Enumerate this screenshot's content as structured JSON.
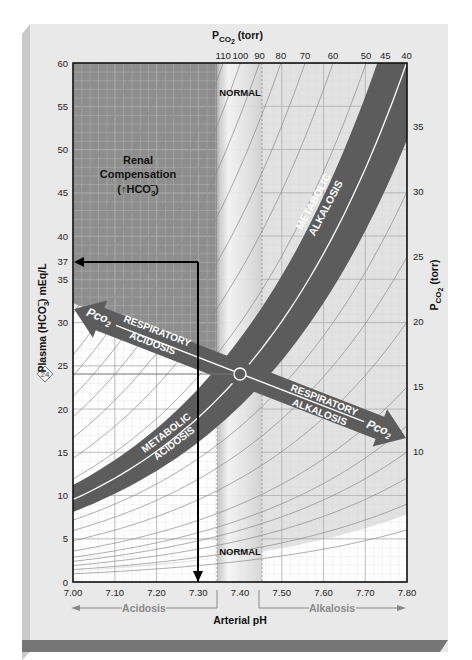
{
  "title": {
    "top_axis_title_main": "P",
    "top_axis_title_sub": "CO",
    "top_axis_title_subsub": "2",
    "top_axis_title_unit": " (torr)"
  },
  "colors": {
    "panel_bg": "#e9e9e9",
    "panel_left_edge": "#cfcfcf",
    "panel_bottom_edge": "#7a7a7a",
    "renal_region": "#8e8e8e",
    "upper_region": "#e2e2e2",
    "lower_region": "#ffffff",
    "band": "#5c5c5c",
    "band_line": "#ffffff",
    "normal_band": "#f1f1f1",
    "normal_band_edge": "#bdbdbd",
    "grid_minor": "#cfcfcf",
    "grid_major": "#a9a9a9",
    "isopleth": "#8a8a8a",
    "frame": "#111111",
    "axis_text": "#222222",
    "region_text": "#8a8a8a"
  },
  "labels": {
    "normal_top": "NORMAL",
    "normal_bottom": "NORMAL",
    "renal_line1": "Renal",
    "renal_line2": "Compensation",
    "renal_line3_pre": "(↑HCO",
    "renal_line3_sub": "3",
    "renal_line3_sup": "−",
    "renal_line3_post": ")",
    "metabolic_alkalosis_1": "METABOLIC",
    "metabolic_alkalosis_2": "ALKALOSIS",
    "metabolic_acidosis_1": "METABOLIC",
    "metabolic_acidosis_2": "ACIDOSIS",
    "respiratory_acidosis_1": "RESPIRATORY",
    "respiratory_acidosis_2": "ACIDOSIS",
    "respiratory_alkalosis_1": "RESPIRATORY",
    "respiratory_alkalosis_2": "ALKALOSIS",
    "pco2_arrow_main": "Pco",
    "pco2_arrow_sub": "2",
    "normal_marker": "24",
    "acidosis": "Acidosis",
    "alkalosis": "Alkalosis"
  },
  "chart_data": {
    "type": "diagram",
    "xlabel": "Arterial pH",
    "ylabel": "Plasma (HCO3−) mEq/L",
    "y2label": "PCO2 (torr)",
    "x2label": "PCO2 (torr)",
    "xlim": [
      7.0,
      7.8
    ],
    "ylim": [
      0,
      60
    ],
    "x_ticks": [
      "7.00",
      "7.10",
      "7.20",
      "7.30",
      "7.40",
      "7.50",
      "7.60",
      "7.70",
      "7.80"
    ],
    "y_ticks": [
      "0",
      "5",
      "10",
      "15",
      "20",
      "25",
      "30",
      "35",
      "37",
      "40",
      "45",
      "50",
      "55",
      "60"
    ],
    "top_pco2_ticks": [
      "110",
      "100",
      "90",
      "80",
      "70",
      "60",
      "50",
      "45",
      "40"
    ],
    "right_pco2_ticks": [
      "35",
      "30",
      "25",
      "20",
      "15",
      "10"
    ],
    "isopleths_pco2": [
      4,
      6,
      8,
      10,
      12,
      15,
      20,
      25,
      30,
      35,
      40,
      45,
      50,
      60,
      70,
      80,
      90,
      100,
      110,
      130,
      150,
      180,
      220
    ],
    "normal_point": {
      "ph": 7.4,
      "hco3": 24,
      "pco2": 40
    },
    "normal_ph_band": [
      7.35,
      7.45
    ],
    "example_case": {
      "ph": 7.3,
      "hco3": 37,
      "annotation": "arrows from pH 7.30 up to HCO3 37 and left to y-axis"
    },
    "regions": [
      "Renal Compensation (↑HCO3−)",
      "Metabolic Alkalosis",
      "Metabolic Acidosis",
      "Respiratory Acidosis",
      "Respiratory Alkalosis",
      "Normal"
    ],
    "metabolic_band_pco2": [
      34,
      47
    ],
    "buffer_line": {
      "points": [
        [
          7.0,
          31.8
        ],
        [
          7.4,
          24.0
        ],
        [
          7.8,
          10.2
        ]
      ]
    }
  },
  "axes": {
    "x_title": "Arterial pH",
    "y_title_pre": "Plasma (HCO",
    "y_title_sub": "3",
    "y_title_sup": "−",
    "y_title_post": ") mEq/L",
    "y2_title_main": "P",
    "y2_title_sub": "CO",
    "y2_title_subsub": "2",
    "y2_title_unit": " (torr)"
  }
}
